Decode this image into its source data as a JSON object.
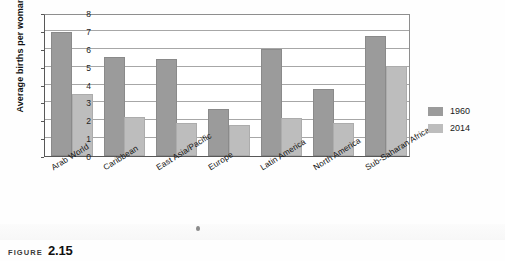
{
  "chart_data": {
    "type": "bar",
    "title": "",
    "xlabel": "",
    "ylabel": "Average births per woman",
    "ylim": [
      0,
      8
    ],
    "yticks": [
      "0",
      "1",
      "2",
      "3",
      "4",
      "5",
      "6",
      "7",
      "8"
    ],
    "grid": true,
    "legend_position": "right",
    "categories": [
      "Arab World",
      "Caribbean",
      "East Asia/Pacific",
      "Europe",
      "Latin America",
      "North America",
      "Sub-Saharan Africa"
    ],
    "series": [
      {
        "name": "1960",
        "color": "#9b9b9b",
        "values": [
          6.85,
          5.4,
          5.3,
          2.5,
          5.9,
          3.65,
          6.6
        ]
      },
      {
        "name": "2014",
        "color": "#bdbdbd",
        "values": [
          3.35,
          2.05,
          1.75,
          1.6,
          2.0,
          1.75,
          4.9
        ]
      }
    ]
  },
  "legend": {
    "items": [
      {
        "label": "1960"
      },
      {
        "label": "2014"
      }
    ]
  },
  "caption": {
    "kicker": "FIGURE",
    "number": "2.15"
  }
}
